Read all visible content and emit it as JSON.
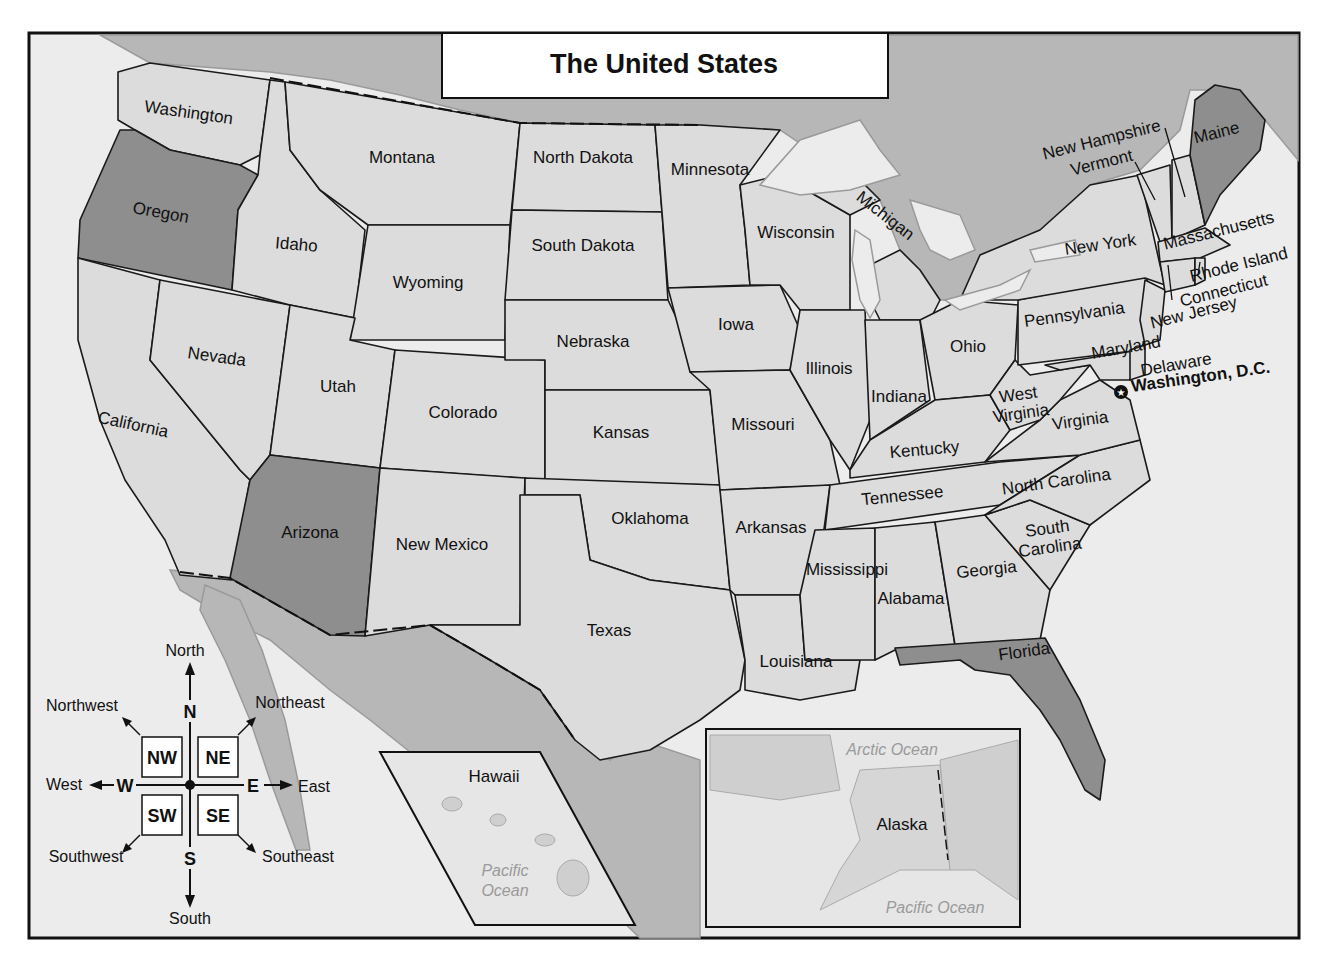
{
  "title": "The United States",
  "colors": {
    "state_fill": "#dcdcdc",
    "highlight_fill": "#8e8e8e",
    "water": "#ececec",
    "foreign_land": "#b7b7b7",
    "border": "#1a1a1a"
  },
  "highlighted_states": [
    "Oregon",
    "Arizona",
    "Maine",
    "Florida"
  ],
  "states": [
    {
      "name": "Washington",
      "x": 188,
      "y": 118,
      "rot": 8
    },
    {
      "name": "Oregon",
      "x": 160,
      "y": 218,
      "rot": 10
    },
    {
      "name": "California",
      "x": 132,
      "y": 430,
      "rot": 12
    },
    {
      "name": "Nevada",
      "x": 216,
      "y": 362,
      "rot": 8
    },
    {
      "name": "Idaho",
      "x": 296,
      "y": 250,
      "rot": 5
    },
    {
      "name": "Montana",
      "x": 402,
      "y": 163,
      "rot": 0
    },
    {
      "name": "Wyoming",
      "x": 428,
      "y": 288,
      "rot": 0
    },
    {
      "name": "Utah",
      "x": 338,
      "y": 392,
      "rot": 0
    },
    {
      "name": "Colorado",
      "x": 463,
      "y": 418,
      "rot": 0
    },
    {
      "name": "Arizona",
      "x": 310,
      "y": 538,
      "rot": 0
    },
    {
      "name": "New Mexico",
      "x": 442,
      "y": 550,
      "rot": 0
    },
    {
      "name": "North Dakota",
      "x": 583,
      "y": 163,
      "rot": 0
    },
    {
      "name": "South Dakota",
      "x": 583,
      "y": 251,
      "rot": 0
    },
    {
      "name": "Nebraska",
      "x": 593,
      "y": 347,
      "rot": 0
    },
    {
      "name": "Kansas",
      "x": 621,
      "y": 438,
      "rot": 0
    },
    {
      "name": "Oklahoma",
      "x": 650,
      "y": 524,
      "rot": 0
    },
    {
      "name": "Texas",
      "x": 609,
      "y": 636,
      "rot": 0
    },
    {
      "name": "Minnesota",
      "x": 710,
      "y": 175,
      "rot": 0
    },
    {
      "name": "Iowa",
      "x": 736,
      "y": 330,
      "rot": 0
    },
    {
      "name": "Missouri",
      "x": 763,
      "y": 430,
      "rot": 0
    },
    {
      "name": "Arkansas",
      "x": 771,
      "y": 533,
      "rot": 0
    },
    {
      "name": "Louisiana",
      "x": 796,
      "y": 667,
      "rot": 0
    },
    {
      "name": "Wisconsin",
      "x": 796,
      "y": 238,
      "rot": 0
    },
    {
      "name": "Michigan",
      "x": 882,
      "y": 220,
      "rot": 38
    },
    {
      "name": "Illinois",
      "x": 829,
      "y": 374,
      "rot": 0
    },
    {
      "name": "Indiana",
      "x": 899,
      "y": 402,
      "rot": 0
    },
    {
      "name": "Ohio",
      "x": 968,
      "y": 352,
      "rot": 0
    },
    {
      "name": "Kentucky",
      "x": 925,
      "y": 455,
      "rot": -5
    },
    {
      "name": "Tennessee",
      "x": 903,
      "y": 501,
      "rot": -6
    },
    {
      "name": "Mississippi",
      "x": 847,
      "y": 575,
      "rot": 0
    },
    {
      "name": "Alabama",
      "x": 911,
      "y": 604,
      "rot": 0
    },
    {
      "name": "Georgia",
      "x": 987,
      "y": 575,
      "rot": -6
    },
    {
      "name": "Florida",
      "x": 1025,
      "y": 657,
      "rot": -8
    },
    {
      "name": "South Carolina",
      "x": 1048,
      "y": 534,
      "rot": -8,
      "lines": [
        "South",
        "Carolina"
      ]
    },
    {
      "name": "North Carolina",
      "x": 1057,
      "y": 487,
      "rot": -8
    },
    {
      "name": "Virginia",
      "x": 1081,
      "y": 426,
      "rot": -8
    },
    {
      "name": "West Virginia",
      "x": 1019,
      "y": 400,
      "rot": -8,
      "lines": [
        "West",
        "Virginia"
      ]
    },
    {
      "name": "Pennsylvania",
      "x": 1075,
      "y": 320,
      "rot": -8
    },
    {
      "name": "New York",
      "x": 1101,
      "y": 250,
      "rot": -8
    },
    {
      "name": "Maryland",
      "x": 1127,
      "y": 353,
      "rot": -10
    },
    {
      "name": "Delaware",
      "x": 1177,
      "y": 370,
      "rot": -10
    },
    {
      "name": "New Jersey",
      "x": 1195,
      "y": 318,
      "rot": -14
    },
    {
      "name": "Connecticut",
      "x": 1225,
      "y": 296,
      "rot": -14
    },
    {
      "name": "Rhode Island",
      "x": 1240,
      "y": 270,
      "rot": -14
    },
    {
      "name": "Massachusetts",
      "x": 1220,
      "y": 236,
      "rot": -14
    },
    {
      "name": "Vermont",
      "x": 1103,
      "y": 168,
      "rot": -14
    },
    {
      "name": "New Hampshire",
      "x": 1103,
      "y": 145,
      "rot": -14
    },
    {
      "name": "Maine",
      "x": 1218,
      "y": 138,
      "rot": -14
    }
  ],
  "capital": {
    "name": "Washington, D.C.",
    "icon": "star-in-circle-icon"
  },
  "insets": {
    "hawaii": {
      "label": "Hawaii",
      "ocean": [
        "Pacific",
        "Ocean"
      ]
    },
    "alaska": {
      "label": "Alaska",
      "arctic": "Arctic Ocean",
      "pacific": "Pacific Ocean"
    }
  },
  "compass": {
    "cardinal": {
      "n": "N",
      "s": "S",
      "e": "E",
      "w": "W"
    },
    "intercardinal": {
      "nw": "NW",
      "ne": "NE",
      "sw": "SW",
      "se": "SE"
    },
    "labels": {
      "north": "North",
      "south": "South",
      "east": "East",
      "west": "West",
      "northwest": "Northwest",
      "northeast": "Northeast",
      "southwest": "Southwest",
      "southeast": "Southeast"
    }
  }
}
